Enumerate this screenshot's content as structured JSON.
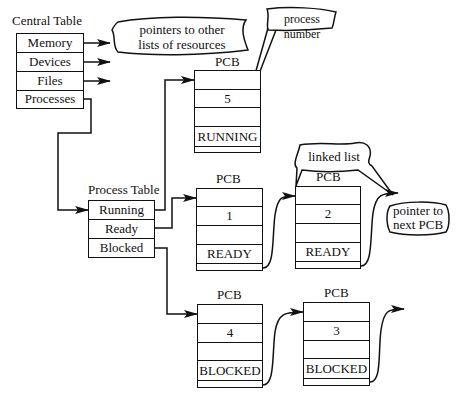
{
  "central_table": {
    "title": "Central Table",
    "rows": [
      "Memory",
      "Devices",
      "Files",
      "Processes"
    ]
  },
  "process_table": {
    "title": "Process Table",
    "rows": [
      "Running",
      "Ready",
      "Blocked"
    ]
  },
  "pcbs": [
    {
      "title": "PCB",
      "number": "5",
      "state": "RUNNING"
    },
    {
      "title": "PCB",
      "number": "1",
      "state": "READY"
    },
    {
      "title": "PCB",
      "number": "2",
      "state": "READY"
    },
    {
      "title": "PCB",
      "number": "4",
      "state": "BLOCKED"
    },
    {
      "title": "PCB",
      "number": "3",
      "state": "BLOCKED"
    }
  ],
  "callouts": {
    "resources": "pointers to other lists of resources",
    "resources_line1": "pointers to other",
    "resources_line2": "lists of resources",
    "process_number": "process number",
    "linked_list": "linked list",
    "next_pcb_line1": "pointer to",
    "next_pcb_line2": "next PCB"
  }
}
